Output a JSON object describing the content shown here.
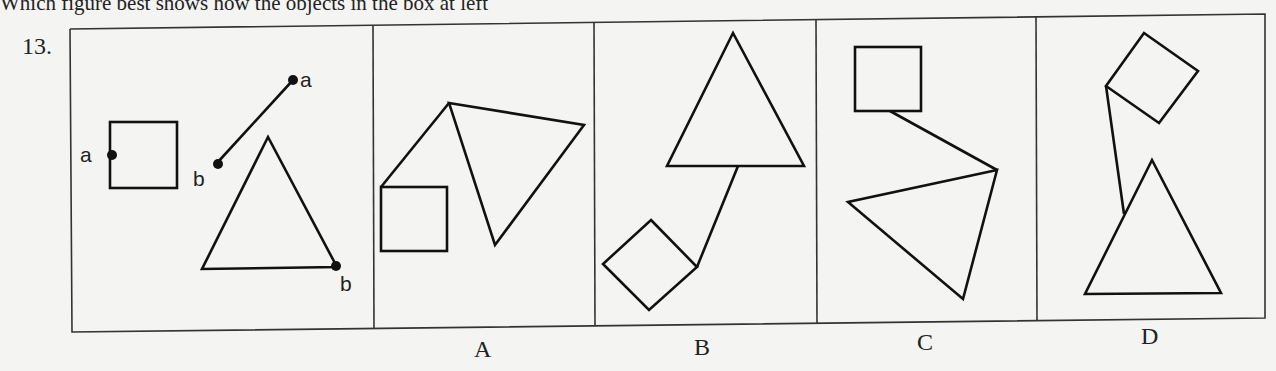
{
  "question": {
    "prompt_partial": "Which figure best shows how the objects in the box at left",
    "number": "13."
  },
  "figure": {
    "stroke_color": "#111111",
    "background": "#f4f4f2",
    "given_panel": {
      "point_labels": [
        "a",
        "a",
        "b",
        "b"
      ],
      "description": "square with point a on left edge; segment from b to a; triangle with point b at bottom-right vertex"
    },
    "options": [
      {
        "label": "A",
        "description": "square top-left corner joined by segment to triangle top vertex"
      },
      {
        "label": "B",
        "description": "rotated square joined by segment from right vertex to triangle base"
      },
      {
        "label": "C",
        "description": "square bottom edge joined by segment to triangle right vertex"
      },
      {
        "label": "D",
        "description": "rotated square left vertex joined by segment to triangle left side"
      }
    ]
  }
}
